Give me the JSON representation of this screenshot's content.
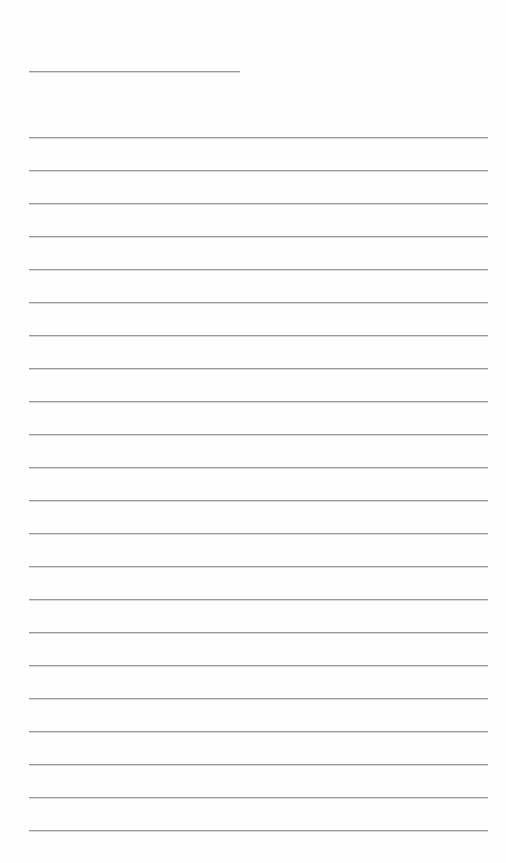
{
  "document": {
    "type": "lined-paper",
    "header_line": {
      "x": 29,
      "y": 71,
      "width": 211
    },
    "ruled_lines": {
      "count": 22,
      "start_y": 137,
      "spacing": 33,
      "x": 29,
      "width": 459
    },
    "line_color": "#9a9a9a",
    "background_color": "#ffffff"
  }
}
